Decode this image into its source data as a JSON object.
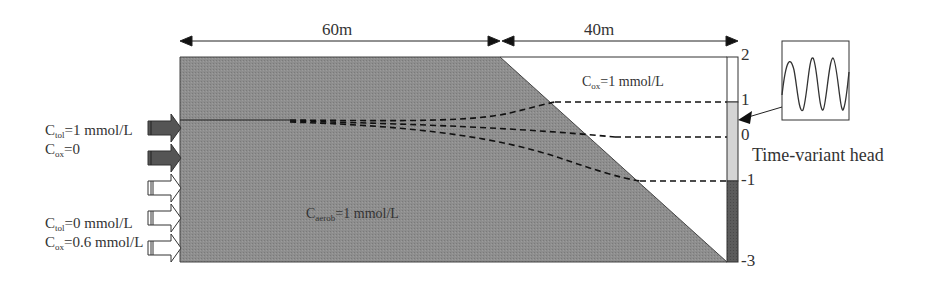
{
  "dimensions": {
    "left_span": "60m",
    "right_span": "40m"
  },
  "inflow_labels": {
    "upper": {
      "line1_sym": "C",
      "line1_sub": "tol",
      "line1_val": "=1 mmol/L",
      "line2_sym": "C",
      "line2_sub": "ox",
      "line2_val": "=0"
    },
    "lower": {
      "line1_sym": "C",
      "line1_sub": "tol",
      "line1_val": "=0 mmol/L",
      "line2_sym": "C",
      "line2_sub": "ox",
      "line2_val": "=0.6 mmol/L"
    }
  },
  "domain_labels": {
    "aquifer": {
      "sym": "C",
      "sub": "aerob",
      "val": "=1 mmol/L"
    },
    "river": {
      "sym": "C",
      "sub": "ox",
      "val": "=1 mmol/L"
    }
  },
  "head_scale": {
    "ticks": [
      "2",
      "1",
      "0",
      "-1",
      "-3"
    ],
    "caption": "Time-variant head"
  },
  "colors": {
    "aquifer_fill": "#8c8c8c",
    "dark_arrow": "#555555",
    "bar_light": "#d4d4d4",
    "bar_dark": "#5a5a5a"
  }
}
